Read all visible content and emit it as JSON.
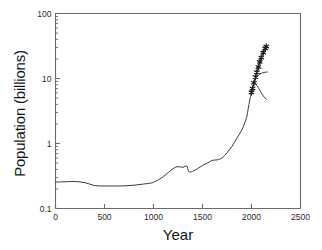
{
  "chart_data": {
    "type": "line",
    "title": "",
    "xlabel": "Year",
    "ylabel": "Population (billions)",
    "xlim": [
      0,
      2500
    ],
    "ylim": [
      0.1,
      100
    ],
    "yscale": "log",
    "xscale": "linear",
    "grid": false,
    "legend": null,
    "xticks": [
      0,
      500,
      1000,
      1500,
      2000,
      2500
    ],
    "xticklabels": [
      "0",
      "500",
      "1000",
      "1500",
      "2000",
      "2500"
    ],
    "yticks": [
      0.1,
      1,
      10,
      100
    ],
    "yticklabels": [
      "0.1",
      "1",
      "10",
      "100"
    ],
    "yminorticks": [
      0.2,
      0.3,
      0.4,
      0.5,
      0.6,
      0.7,
      0.8,
      0.9,
      2,
      3,
      4,
      5,
      6,
      7,
      8,
      9,
      20,
      30,
      40,
      50,
      60,
      70,
      80,
      90
    ],
    "series": [
      {
        "name": "historical-population",
        "marker": "none",
        "x": [
          0,
          100,
          200,
          300,
          400,
          500,
          600,
          700,
          800,
          900,
          1000,
          1100,
          1200,
          1250,
          1300,
          1340,
          1360,
          1400,
          1450,
          1500,
          1550,
          1600,
          1650,
          1700,
          1750,
          1800,
          1850,
          1900,
          1927,
          1950,
          1960,
          1974,
          1987,
          1999,
          2000
        ],
        "y": [
          0.255,
          0.258,
          0.26,
          0.25,
          0.225,
          0.222,
          0.222,
          0.223,
          0.228,
          0.238,
          0.253,
          0.31,
          0.41,
          0.44,
          0.43,
          0.45,
          0.37,
          0.375,
          0.41,
          0.46,
          0.5,
          0.55,
          0.56,
          0.6,
          0.72,
          0.9,
          1.2,
          1.6,
          2.0,
          2.5,
          3.0,
          4.0,
          5.0,
          6.0,
          6.1
        ]
      },
      {
        "name": "projection-high",
        "marker": "asterisk",
        "x": [
          2000,
          2010,
          2025,
          2040,
          2055,
          2070,
          2085,
          2100,
          2120,
          2140,
          2150
        ],
        "y": [
          6.1,
          7.0,
          8.6,
          10.5,
          12.5,
          15.0,
          18.0,
          21.0,
          25.0,
          29.0,
          31.0
        ]
      },
      {
        "name": "projection-medium",
        "marker": "none",
        "x": [
          2010,
          2040,
          2070,
          2100,
          2130,
          2160
        ],
        "y": [
          7.3,
          9.7,
          11.3,
          12.0,
          12.4,
          12.6
        ]
      },
      {
        "name": "projection-low",
        "marker": "none",
        "x": [
          2005,
          2030,
          2060,
          2090,
          2120,
          2150
        ],
        "y": [
          6.6,
          8.4,
          7.6,
          6.4,
          5.4,
          4.8
        ]
      }
    ],
    "annotations": []
  },
  "axes": {
    "frame_color": "#6b6b6b",
    "line_color": "#3a3a3a",
    "marker_color": "#1a1a1a"
  }
}
